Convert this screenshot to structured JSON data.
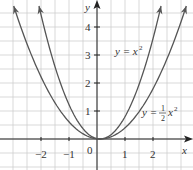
{
  "chart_data": {
    "type": "line",
    "title": "",
    "xlabel": "x",
    "ylabel": "y",
    "xlim": [
      -3.5,
      3.4
    ],
    "ylim": [
      -1,
      5
    ],
    "grid": true,
    "grid_step": 0.5,
    "x_ticks": [
      "-2",
      "-1",
      "0",
      "1",
      "2"
    ],
    "y_ticks": [
      "1",
      "2",
      "3",
      "4"
    ],
    "series": [
      {
        "name": "y = x^2",
        "function": "x^2",
        "x": [
          -2.2,
          -2,
          -1,
          0,
          1,
          2,
          2.2
        ],
        "values": [
          4.84,
          4,
          1,
          0,
          1,
          4,
          4.84
        ]
      },
      {
        "name": "y = 1/2 x^2",
        "function": "0.5*x^2",
        "x": [
          -3.1,
          -3,
          -2,
          -1,
          0,
          1,
          2,
          3,
          3.1
        ],
        "values": [
          4.8,
          4.5,
          2,
          0.5,
          0,
          0.5,
          2,
          4.5,
          4.8
        ]
      }
    ],
    "annotations": [
      {
        "text": "y = x²",
        "x": 0.9,
        "y": 3
      },
      {
        "text": "y = ½ x²",
        "x": 2.5,
        "y": 0.9
      }
    ]
  },
  "labels": {
    "x_axis": "x",
    "y_axis": "y",
    "origin": "0",
    "xt_m2": "−2",
    "xt_m1": "−1",
    "xt_1": "1",
    "xt_2": "2",
    "yt_1": "1",
    "yt_2": "2",
    "yt_3": "3",
    "yt_4": "4",
    "curve1_y": "y = x",
    "curve1_exp": "2",
    "curve2_y": "y =",
    "curve2_num": "1",
    "curve2_den": "2",
    "curve2_x": "x",
    "curve2_exp": "2"
  },
  "colors": {
    "grid": "#c8c8c8",
    "axis": "#222222",
    "curve": "#555555"
  }
}
